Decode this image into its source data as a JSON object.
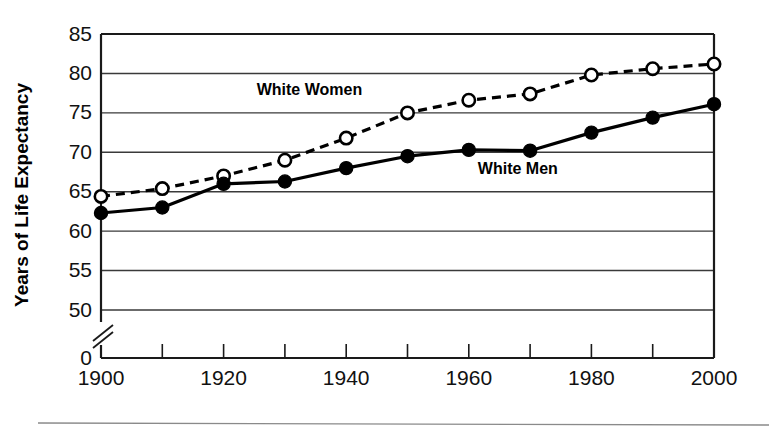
{
  "chart_data": {
    "type": "line",
    "title": "",
    "subtitle": "",
    "xlabel": "",
    "ylabel": "Years of Life Expectancy",
    "x": [
      1900,
      1910,
      1920,
      1930,
      1940,
      1950,
      1960,
      1970,
      1980,
      1990,
      2000
    ],
    "xtick_labels": [
      "1900",
      "1920",
      "1940",
      "1960",
      "1980",
      "2000"
    ],
    "xtick_values": [
      1900,
      1920,
      1940,
      1960,
      1980,
      2000
    ],
    "xminor_tick_values": [
      1910,
      1930,
      1950,
      1970,
      1990
    ],
    "xlim": [
      1900,
      2000
    ],
    "ytick_labels": [
      "0",
      "50",
      "55",
      "60",
      "65",
      "70",
      "75",
      "80",
      "85"
    ],
    "ytick_values": [
      0,
      50,
      55,
      60,
      65,
      70,
      75,
      80,
      85
    ],
    "ylim": [
      50,
      85
    ],
    "axis_break": true,
    "axis_break_note": "y-axis broken between 0 and 50",
    "grid": "horizontal",
    "legend_position": "inline-annotations",
    "series": [
      {
        "name": "White Women",
        "marker": "open-circle",
        "line_style": "dashed",
        "color": "#000000",
        "label_x": 1934,
        "label_y": 77.3,
        "values": [
          64.4,
          65.4,
          67.0,
          69.0,
          71.8,
          75.0,
          76.6,
          77.4,
          79.8,
          80.6,
          81.2
        ]
      },
      {
        "name": "White Men",
        "marker": "filled-circle",
        "line_style": "solid",
        "color": "#000000",
        "label_x": 1968,
        "label_y": 67.2,
        "values": [
          62.3,
          63.0,
          66.0,
          66.3,
          68.0,
          69.5,
          70.3,
          70.2,
          72.5,
          74.4,
          76.1
        ]
      }
    ]
  },
  "annotations": {
    "women_label": "White Women",
    "men_label": "White Men"
  },
  "axes": {
    "y_title": "Years of Life Expectancy"
  }
}
